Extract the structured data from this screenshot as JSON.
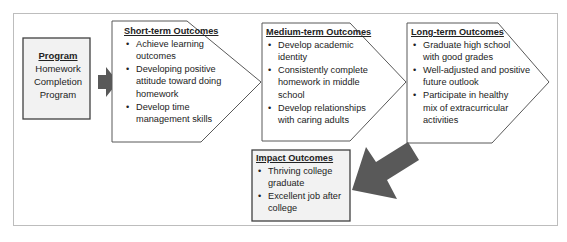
{
  "program": {
    "title": "Program",
    "lines": [
      "Homework",
      "Completion",
      "Program"
    ]
  },
  "short_term": {
    "title": "Short-term Outcomes",
    "items": [
      "Achieve learning outcomes",
      "Developing positive attitude toward doing homework",
      "Develop time management skills"
    ]
  },
  "medium_term": {
    "title": "Medium-term Outcomes",
    "items": [
      "Develop academic identity",
      "Consistently complete homework in middle school",
      "Develop relationships with caring adults"
    ]
  },
  "long_term": {
    "title": "Long-term Outcomes",
    "items": [
      "Graduate high school with good grades",
      "Well-adjusted and positive future outlook",
      "Participate in healthy mix of extracurricular activities"
    ]
  },
  "impact": {
    "title": "Impact Outcomes",
    "items": [
      "Thriving college graduate",
      "Excellent job after college"
    ]
  },
  "colors": {
    "arrow": "#595959",
    "box_fill": "#f2f2f2",
    "border": "#595959"
  }
}
